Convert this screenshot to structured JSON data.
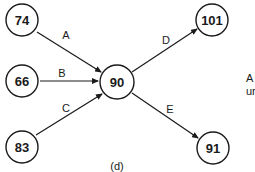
{
  "diagram": {
    "nodes": [
      {
        "id": "n74",
        "label": "74",
        "cx": 22,
        "cy": 20
      },
      {
        "id": "n66",
        "label": "66",
        "cx": 22,
        "cy": 81
      },
      {
        "id": "n83",
        "label": "83",
        "cx": 22,
        "cy": 147
      },
      {
        "id": "n90",
        "label": "90",
        "cx": 117,
        "cy": 82
      },
      {
        "id": "n101",
        "label": "101",
        "cx": 212,
        "cy": 20
      },
      {
        "id": "n91",
        "label": "91",
        "cx": 213,
        "cy": 148
      }
    ],
    "edges": [
      {
        "label": "A",
        "from": "74",
        "to": "90"
      },
      {
        "label": "B",
        "from": "66",
        "to": "90"
      },
      {
        "label": "C",
        "from": "83",
        "to": "90"
      },
      {
        "label": "D",
        "from": "90",
        "to": "101"
      },
      {
        "label": "E",
        "from": "90",
        "to": "91"
      }
    ],
    "caption": "(d)",
    "side_text": {
      "line1": "A",
      "line2": "ur"
    }
  }
}
